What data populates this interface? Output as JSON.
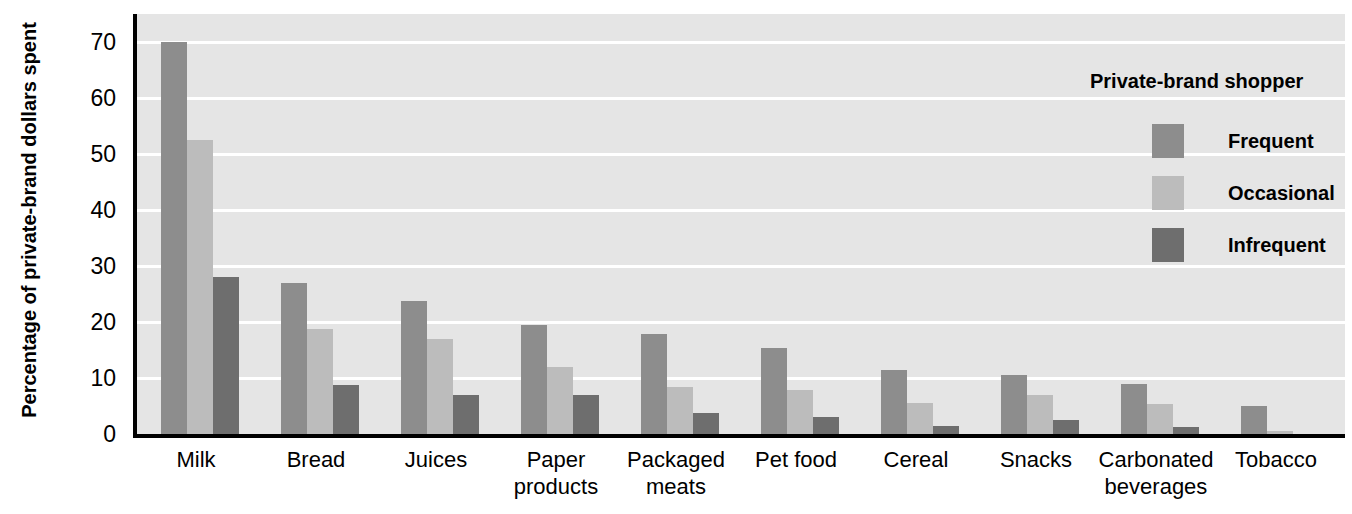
{
  "chart_data": {
    "type": "bar",
    "title": "",
    "xlabel": "",
    "ylabel": "Percentage of\nprivate-brand dollars spent",
    "ylim": [
      0,
      75
    ],
    "ytick_values": [
      0,
      10,
      20,
      30,
      40,
      50,
      60,
      70
    ],
    "ytick_labels": [
      "0",
      "10",
      "20",
      "30",
      "40",
      "50",
      "60",
      "70"
    ],
    "grid": true,
    "legend_position": "top-right",
    "legend_title": "Private-brand shopper",
    "categories": [
      "Milk",
      "Bread",
      "Juices",
      "Paper\nproducts",
      "Packaged\nmeats",
      "Pet food",
      "Cereal",
      "Snacks",
      "Carbonated\nbeverages",
      "Tobacco"
    ],
    "series": [
      {
        "name": "Frequent",
        "color": "#8d8d8d",
        "values": [
          70,
          27,
          23.8,
          19.5,
          17.8,
          15.4,
          11.5,
          10.5,
          9,
          5
        ]
      },
      {
        "name": "Occasional",
        "color": "#bcbcbc",
        "values": [
          52.5,
          18.8,
          17,
          12,
          8.4,
          7.8,
          5.5,
          6.9,
          5.3,
          0.5
        ]
      },
      {
        "name": "Infrequent",
        "color": "#6e6e6e",
        "values": [
          28,
          8.8,
          7,
          7,
          3.8,
          3,
          1.5,
          2.5,
          1.3,
          0
        ]
      }
    ]
  },
  "colors": {
    "frequent": "#8d8d8d",
    "occasional": "#bcbcbc",
    "infrequent": "#6e6e6e",
    "plot_background": "#e5e5e5",
    "gridline": "#ffffff",
    "axis": "#000000",
    "page_background": "#ffffff"
  }
}
